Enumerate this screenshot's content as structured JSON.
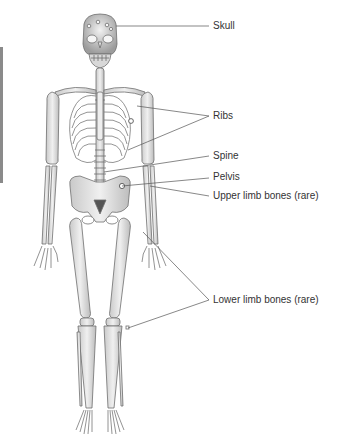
{
  "figure": {
    "colors": {
      "bone_fill": "#e4e4e4",
      "bone_stroke": "#6e6e6e",
      "bone_shadow": "#bdbdbd",
      "leader_line": "#555555",
      "label_text": "#333333",
      "background": "#ffffff"
    }
  },
  "labels": [
    {
      "id": "skull",
      "text": "Skull",
      "x": 213,
      "y": 22
    },
    {
      "id": "ribs",
      "text": "Ribs",
      "x": 213,
      "y": 112
    },
    {
      "id": "spine",
      "text": "Spine",
      "x": 213,
      "y": 152
    },
    {
      "id": "pelvis",
      "text": "Pelvis",
      "x": 213,
      "y": 173
    },
    {
      "id": "upper-limb",
      "text": "Upper limb bones (rare)",
      "x": 213,
      "y": 192
    },
    {
      "id": "lower-limb",
      "text": "Lower limb bones (rare)",
      "x": 213,
      "y": 296
    }
  ]
}
